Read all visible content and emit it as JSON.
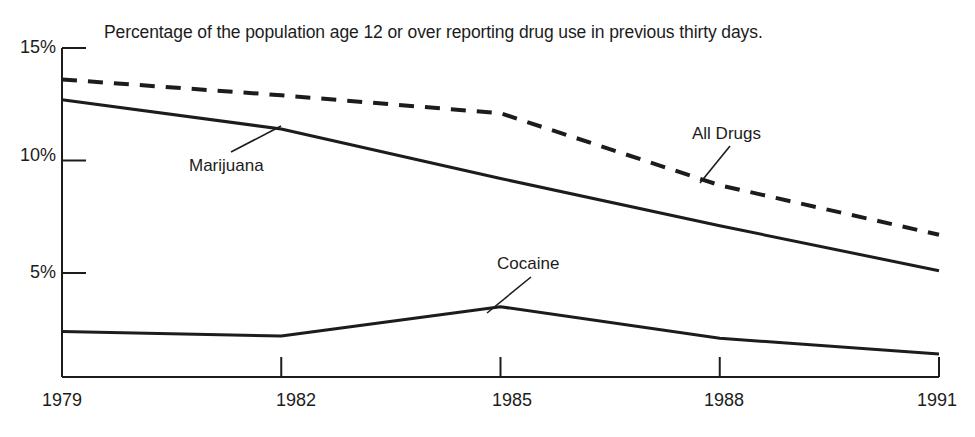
{
  "chart_data": {
    "type": "line",
    "title": "Percentage of the population age 12 or over reporting drug use in previous thirty days.",
    "xlabel": "",
    "ylabel": "",
    "x": [
      1979,
      1982,
      1985,
      1988,
      1991
    ],
    "xlim": [
      1979,
      1991
    ],
    "ylim": [
      0,
      15
    ],
    "grid": false,
    "legend_position": "inline-annotations",
    "y_ticks": [
      {
        "value": 15,
        "label": "15%"
      },
      {
        "value": 10,
        "label": "10%"
      },
      {
        "value": 5,
        "label": "5%"
      }
    ],
    "x_ticks": [
      {
        "value": 1979,
        "label": "1979"
      },
      {
        "value": 1982,
        "label": "1982"
      },
      {
        "value": 1985,
        "label": "1985"
      },
      {
        "value": 1988,
        "label": "1988"
      },
      {
        "value": 1991,
        "label": "1991"
      }
    ],
    "series": [
      {
        "name": "All Drugs",
        "style": "dashed",
        "color": "#1c1c1c",
        "x": [
          1979,
          1982,
          1985,
          1988,
          1991
        ],
        "values": [
          13.6,
          12.9,
          12.1,
          8.9,
          6.7
        ]
      },
      {
        "name": "Marijuana",
        "style": "solid",
        "color": "#1c1c1c",
        "x": [
          1979,
          1982,
          1985,
          1988,
          1991
        ],
        "values": [
          12.7,
          11.4,
          9.2,
          7.1,
          5.1
        ]
      },
      {
        "name": "Cocaine",
        "style": "solid",
        "color": "#1c1c1c",
        "x": [
          1979,
          1982,
          1985,
          1988,
          1991
        ],
        "values": [
          2.4,
          2.2,
          3.5,
          2.1,
          1.4
        ]
      }
    ],
    "annotations": [
      {
        "text": "Marijuana",
        "x": 1982,
        "y": 8.6
      },
      {
        "text": "All Drugs",
        "x": 1988,
        "y": 11.9
      },
      {
        "text": "Cocaine",
        "x": 1985,
        "y": 5.6
      }
    ]
  },
  "axis": {
    "y_labels": [
      "15%",
      "10%",
      "5%"
    ],
    "x_labels": [
      "1979",
      "1982",
      "1985",
      "1988",
      "1991"
    ]
  },
  "annotations": {
    "marijuana": "Marijuana",
    "all_drugs": "All Drugs",
    "cocaine": "Cocaine"
  },
  "colors": {
    "ink": "#1c1c1c",
    "background": "#ffffff"
  }
}
